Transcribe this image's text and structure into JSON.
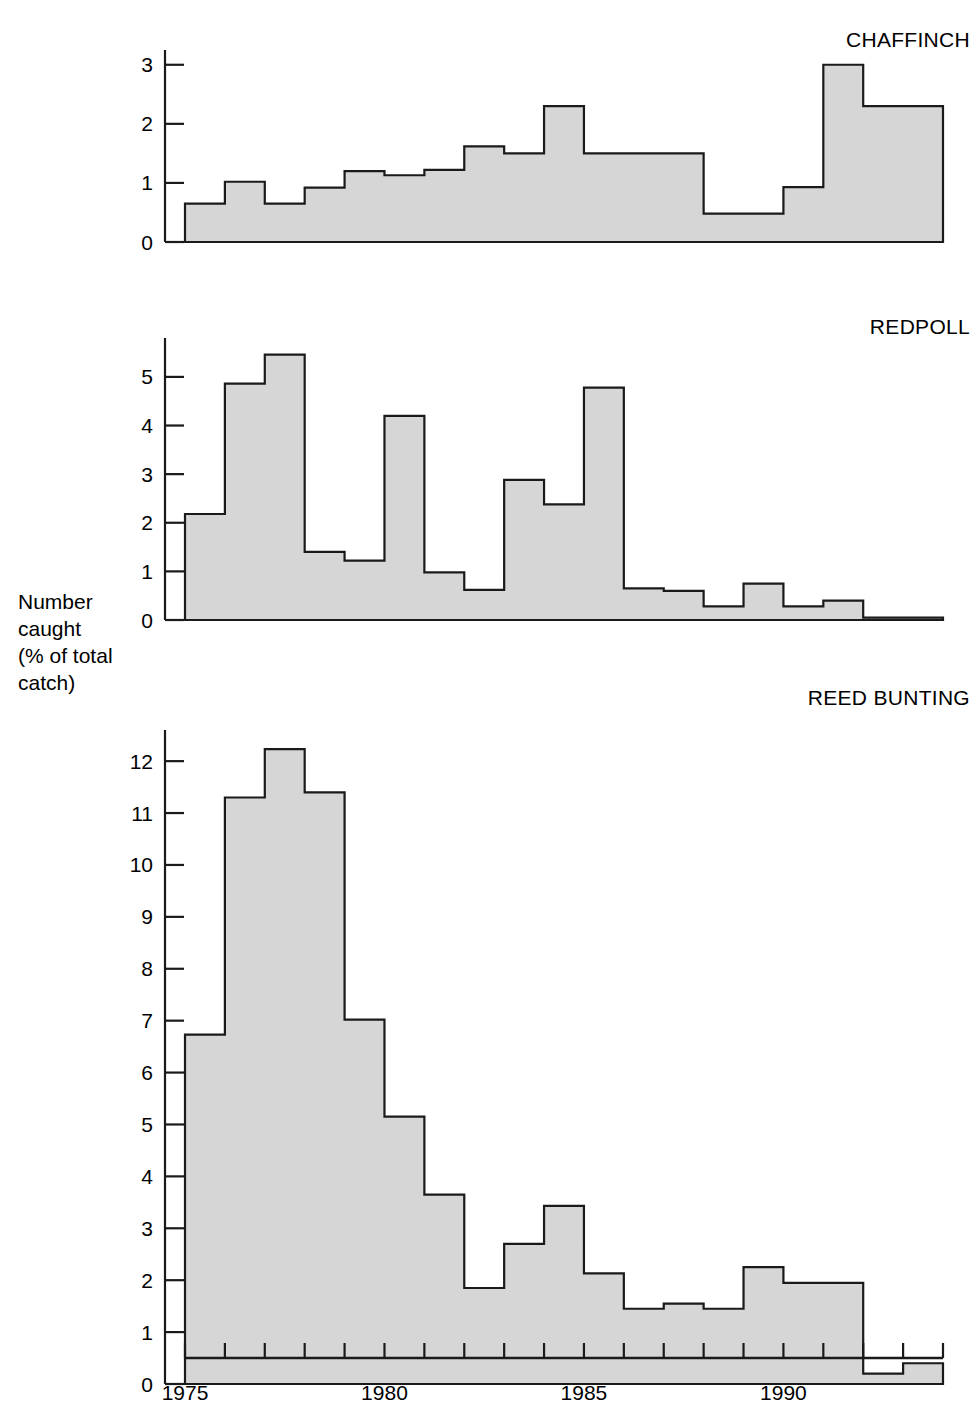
{
  "axis_label": {
    "lines": [
      "Number",
      "caught",
      "(% of total",
      "catch)"
    ]
  },
  "x_axis": {
    "tick_labels": [
      "1975",
      "1980",
      "1985",
      "1990"
    ],
    "tick_years": [
      1975,
      1980,
      1985,
      1990
    ],
    "start_year": 1975,
    "end_year": 1993
  },
  "colors": {
    "bar_fill": "#d6d6d6",
    "bar_stroke": "#1a1a1a",
    "axis": "#1a1a1a",
    "text": "#000000",
    "background": "#ffffff"
  },
  "chart_data": [
    {
      "type": "bar",
      "title": "CHAFFINCH",
      "xlabel": "",
      "ylabel": "Number caught (% of total catch)",
      "grid": false,
      "legend": "none",
      "ylim": [
        0,
        3.25
      ],
      "yticks": [
        0,
        1,
        2,
        3
      ],
      "categories": [
        1975,
        1976,
        1977,
        1978,
        1979,
        1980,
        1981,
        1982,
        1983,
        1984,
        1985,
        1986,
        1987,
        1988,
        1989,
        1990,
        1991,
        1992,
        1993
      ],
      "values": [
        0.65,
        1.02,
        0.65,
        0.92,
        1.2,
        1.13,
        1.22,
        1.62,
        1.5,
        2.3,
        1.5,
        1.5,
        1.5,
        0.48,
        0.48,
        0.93,
        3.0,
        2.3,
        2.3
      ]
    },
    {
      "type": "bar",
      "title": "REDPOLL",
      "xlabel": "",
      "ylabel": "Number caught (% of total catch)",
      "grid": false,
      "legend": "none",
      "ylim": [
        0,
        5.8
      ],
      "yticks": [
        0,
        1,
        2,
        3,
        4,
        5
      ],
      "categories": [
        1975,
        1976,
        1977,
        1978,
        1979,
        1980,
        1981,
        1982,
        1983,
        1984,
        1985,
        1986,
        1987,
        1988,
        1989,
        1990,
        1991,
        1992,
        1993
      ],
      "values": [
        2.18,
        4.86,
        5.46,
        1.4,
        1.22,
        4.2,
        0.98,
        0.62,
        2.88,
        2.38,
        4.78,
        0.65,
        0.6,
        0.28,
        0.75,
        0.28,
        0.4,
        0.05,
        0.05
      ]
    },
    {
      "type": "bar",
      "title": "REED BUNTING",
      "xlabel": "",
      "ylabel": "Number caught (% of total catch)",
      "grid": false,
      "legend": "none",
      "ylim": [
        0,
        12.6
      ],
      "yticks": [
        0,
        1,
        2,
        3,
        4,
        5,
        6,
        7,
        8,
        9,
        10,
        11,
        12
      ],
      "categories": [
        1975,
        1976,
        1977,
        1978,
        1979,
        1980,
        1981,
        1982,
        1983,
        1984,
        1985,
        1986,
        1987,
        1988,
        1989,
        1990,
        1991,
        1992,
        1993
      ],
      "values": [
        6.73,
        11.3,
        12.23,
        11.4,
        7.02,
        5.15,
        3.65,
        1.85,
        2.7,
        3.43,
        2.13,
        1.45,
        1.55,
        1.45,
        2.25,
        1.95,
        1.95,
        0.2,
        0.4
      ]
    }
  ]
}
